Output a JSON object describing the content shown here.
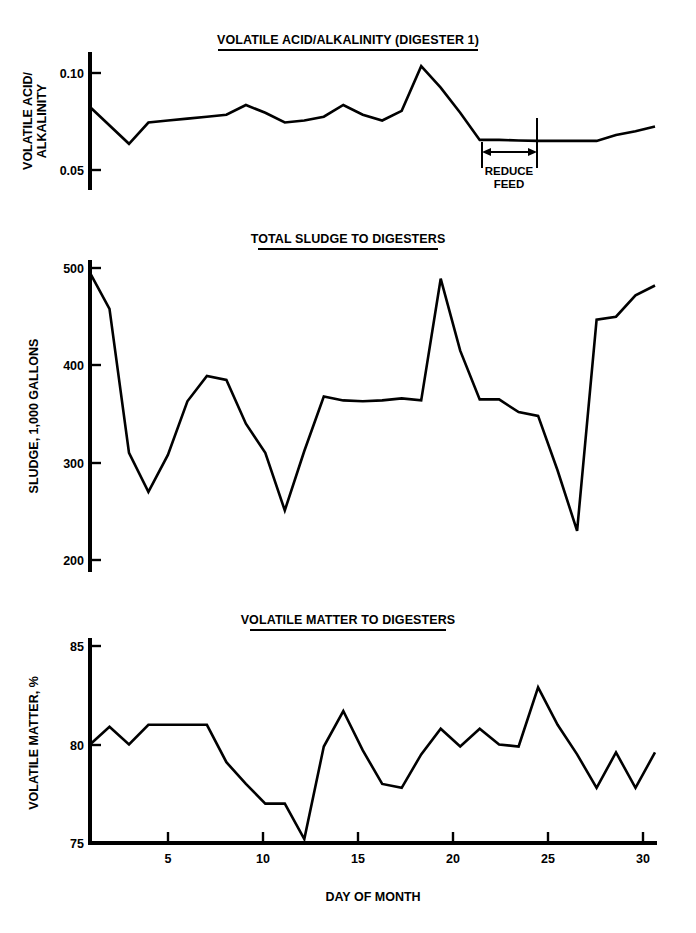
{
  "figure": {
    "background_color": "#ffffff",
    "line_color": "#000000",
    "x_axis_title": "DAY OF MONTH",
    "x_tick_labels": [
      "5",
      "10",
      "15",
      "20",
      "25",
      "30"
    ]
  },
  "chart_data": [
    {
      "type": "line",
      "title": "VOLATILE ACID/ALKALINITY (DIGESTER 1)",
      "xlabel": "",
      "ylabel": "VOLATILE ACID/\nALKALINITY",
      "ylabel_line1": "VOLATILE ACID/",
      "ylabel_line2": "ALKALINITY",
      "grid": false,
      "legend": "none",
      "xlim": [
        1,
        30
      ],
      "ylim": [
        0.042,
        0.112
      ],
      "ytick_labels": [
        "0.10",
        "0.05"
      ],
      "yticks": [
        0.1,
        0.05
      ],
      "x": [
        1,
        2,
        3,
        4,
        5,
        6,
        7,
        8,
        9,
        10,
        11,
        12,
        13,
        14,
        15,
        16,
        17,
        18,
        19,
        20,
        21,
        22,
        23,
        24,
        25,
        26,
        27,
        28,
        29,
        30
      ],
      "values": [
        0.0825,
        null,
        0.0635,
        0.0745,
        0.0755,
        0.0765,
        0.0775,
        0.0785,
        0.0835,
        0.0795,
        0.0745,
        0.0755,
        0.0775,
        0.0835,
        0.0785,
        0.0755,
        0.0805,
        0.1035,
        0.0925,
        0.0795,
        0.0655,
        0.0655,
        0.0652,
        0.065,
        0.065,
        0.065,
        0.065,
        0.068,
        0.07,
        0.0725
      ],
      "annotations": [
        {
          "text_line1": "REDUCE",
          "text_line2": "FEED",
          "type": "double-arrow-span",
          "x_start": 21,
          "x_end": 24
        }
      ]
    },
    {
      "type": "line",
      "title": "TOTAL SLUDGE TO DIGESTERS",
      "xlabel": "",
      "ylabel": "SLUDGE, 1,000 GALLONS",
      "grid": false,
      "legend": "none",
      "xlim": [
        1,
        30
      ],
      "ylim": [
        190,
        512
      ],
      "ytick_labels": [
        "500",
        "400",
        "300",
        "200"
      ],
      "yticks": [
        500,
        400,
        300,
        200
      ],
      "x": [
        1,
        2,
        3,
        4,
        5,
        6,
        7,
        8,
        9,
        10,
        11,
        12,
        13,
        14,
        15,
        16,
        17,
        18,
        19,
        20,
        21,
        22,
        23,
        24,
        25,
        26,
        27,
        28,
        29,
        30
      ],
      "values": [
        495,
        458,
        310,
        270,
        308,
        363,
        389,
        385,
        340,
        310,
        251,
        312,
        368,
        364,
        363,
        364,
        366,
        364,
        489,
        415,
        365,
        365,
        352,
        348,
        292,
        230,
        447,
        450,
        472,
        482
      ]
    },
    {
      "type": "line",
      "title": "VOLATILE MATTER TO DIGESTERS",
      "xlabel": "DAY OF MONTH",
      "ylabel": "VOLATILE MATTER, %",
      "grid": false,
      "legend": "none",
      "xlim": [
        1,
        30
      ],
      "ylim": [
        75,
        85.6
      ],
      "ytick_labels": [
        "85",
        "80",
        "75"
      ],
      "yticks": [
        85,
        80,
        75
      ],
      "x": [
        1,
        2,
        3,
        4,
        5,
        6,
        7,
        8,
        9,
        10,
        11,
        12,
        13,
        14,
        15,
        16,
        17,
        18,
        19,
        20,
        21,
        22,
        23,
        24,
        25,
        26,
        27,
        28,
        29,
        30
      ],
      "values": [
        80.0,
        80.9,
        80.0,
        81.0,
        81.0,
        81.0,
        81.0,
        79.1,
        78.0,
        77.0,
        77.0,
        75.2,
        79.9,
        81.7,
        79.7,
        78.0,
        77.8,
        79.5,
        80.8,
        79.9,
        80.8,
        80.0,
        79.9,
        82.9,
        81.0,
        79.5,
        77.8,
        79.6,
        77.8,
        79.6
      ]
    }
  ]
}
